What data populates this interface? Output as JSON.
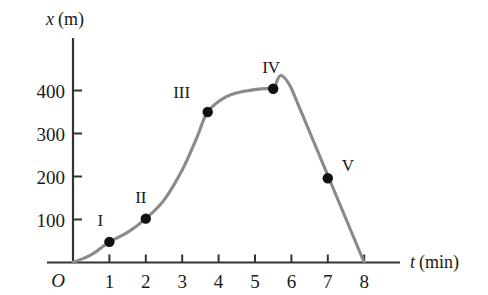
{
  "chart_data": {
    "type": "line",
    "title": "",
    "xlabel": "t (min)",
    "xlabel_symbol": "t",
    "xlabel_unit": "(min)",
    "ylabel": "x (m)",
    "ylabel_symbol": "x",
    "ylabel_unit": "(m)",
    "origin_label": "O",
    "xlim": [
      0,
      8
    ],
    "ylim": [
      0,
      440
    ],
    "grid": false,
    "legend": "none",
    "xticks": [
      1,
      2,
      3,
      4,
      5,
      6,
      7,
      8
    ],
    "xtick_labels": [
      "1",
      "2",
      "3",
      "4",
      "5",
      "6",
      "7",
      "8"
    ],
    "yticks": [
      100,
      200,
      300,
      400
    ],
    "ytick_labels": [
      "100",
      "200",
      "300",
      "400"
    ],
    "line_color": "#8a8a8a",
    "marker_color": "#111111",
    "axis_color": "#333333",
    "series": [
      {
        "name": "position vs time",
        "x": [
          0,
          0.5,
          1.0,
          1.5,
          2.0,
          2.5,
          3.0,
          3.4,
          3.7,
          4.2,
          4.7,
          5.2,
          5.5,
          6.0,
          8.0
        ],
        "y": [
          0,
          18,
          48,
          70,
          102,
          145,
          215,
          290,
          350,
          385,
          398,
          404,
          405,
          405,
          0
        ]
      }
    ],
    "points": [
      {
        "label": "I",
        "t": 1.0,
        "x": 48,
        "label_dx": -9,
        "label_dy": -13
      },
      {
        "label": "II",
        "t": 2.0,
        "x": 102,
        "label_dx": -5,
        "label_dy": -13
      },
      {
        "label": "III",
        "t": 3.7,
        "x": 350,
        "label_dx": -26,
        "label_dy": -11
      },
      {
        "label": "IV",
        "t": 5.5,
        "x": 404,
        "label_dx": -2,
        "label_dy": -13
      },
      {
        "label": "V",
        "t": 7.0,
        "x": 196,
        "label_dx": 20,
        "label_dy": -4
      }
    ],
    "annotations": [
      "Segment O to IV: position increases from 0 m to about 404 m",
      "Plateau from about 5.5 min to 6.0 min at about 405 m",
      "Segment from 6 min to 8 min: straight decline from 405 m to 0 m"
    ]
  }
}
